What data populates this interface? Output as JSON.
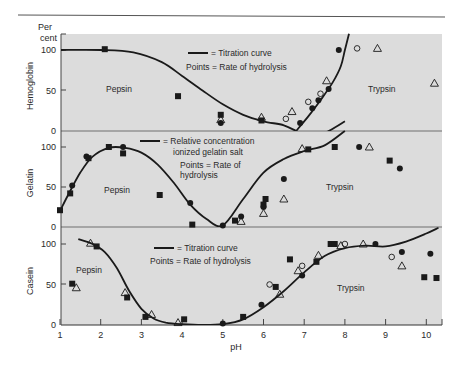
{
  "chart_data": {
    "type": "scatter",
    "title": "",
    "xlabel": "pH",
    "ylabel": "Per cent",
    "xlim": [
      1,
      10.3
    ],
    "x_ticks": [
      1,
      2,
      3,
      4,
      5,
      6,
      7,
      8,
      9,
      10
    ],
    "grid": false,
    "panels": [
      {
        "name": "Hemoglobin",
        "ylim": [
          0,
          100
        ],
        "y_ticks": [
          0,
          50,
          100
        ],
        "legend": [
          "= Titration curve",
          "Points = Rate of hydrolysis"
        ],
        "enzyme_labels": [
          {
            "text": "Pepsin",
            "x": 2.3,
            "y": 55
          },
          {
            "text": "Trypsin",
            "x": 8.5,
            "y": 48
          }
        ],
        "curves": [
          {
            "name": "Titration curve (acid)",
            "x": [
              1.0,
              2.0,
              2.8,
              3.5,
              4.0,
              4.5,
              5.0,
              5.5,
              6.0,
              6.5,
              6.8
            ],
            "y": [
              100,
              100,
              97,
              85,
              68,
              50,
              33,
              20,
              12,
              7,
              0
            ]
          },
          {
            "name": "Titration curve (alkaline)",
            "x": [
              6.8,
              7.1,
              7.4,
              7.7,
              7.9,
              8.0,
              8.1
            ],
            "y": [
              0,
              18,
              38,
              60,
              80,
              100,
              120
            ]
          },
          {
            "name": "Gelatin curve tail",
            "x": [
              6.1,
              6.6,
              7.1,
              7.6,
              8.0
            ],
            "y": [
              -30,
              -20,
              -10,
              0,
              12
            ]
          }
        ],
        "points": {
          "square": [
            [
              2.1,
              101
            ],
            [
              3.9,
              43
            ],
            [
              4.95,
              20
            ],
            [
              5.95,
              13
            ]
          ],
          "filled_circle": [
            [
              4.95,
              10
            ],
            [
              6.9,
              10
            ],
            [
              7.2,
              28
            ],
            [
              7.35,
              38
            ],
            [
              7.6,
              52
            ],
            [
              7.85,
              100
            ]
          ],
          "open_circle": [
            [
              6.55,
              15
            ],
            [
              7.1,
              36
            ],
            [
              7.4,
              46
            ],
            [
              8.3,
              102
            ]
          ],
          "triangle": [
            [
              4.95,
              14
            ],
            [
              5.95,
              17
            ],
            [
              6.7,
              24
            ],
            [
              7.55,
              62
            ],
            [
              8.8,
              102
            ],
            [
              10.2,
              59
            ]
          ]
        }
      },
      {
        "name": "Gelatin",
        "ylim": [
          0,
          100
        ],
        "y_ticks": [
          0,
          50,
          100
        ],
        "legend": [
          "= Relative concentration",
          "ionized gelatin salt",
          "Points = Rate of",
          "hydrolysis"
        ],
        "enzyme_labels": [
          {
            "text": "Pepsin",
            "x": 2.4,
            "y": 45
          },
          {
            "text": "Trypsin",
            "x": 7.7,
            "y": 47
          }
        ],
        "curves": [
          {
            "name": "Relative concentration ionized gelatin salt",
            "x": [
              1.0,
              1.2,
              1.5,
              1.8,
              2.2,
              2.6,
              3.0,
              3.4,
              3.8,
              4.2,
              4.6,
              5.0,
              5.5,
              6.0,
              6.5,
              7.0,
              7.5,
              8.0
            ],
            "y": [
              20,
              40,
              68,
              88,
              99,
              99,
              93,
              78,
              55,
              28,
              10,
              2,
              35,
              68,
              85,
              95,
              102,
              120
            ]
          }
        ],
        "points": {
          "square": [
            [
              1.0,
              21
            ],
            [
              1.25,
              42
            ],
            [
              1.7,
              86
            ],
            [
              2.2,
              100
            ],
            [
              2.55,
              92
            ],
            [
              3.45,
              40
            ],
            [
              4.25,
              3
            ],
            [
              5.3,
              8
            ],
            [
              6.0,
              28
            ],
            [
              6.05,
              35
            ],
            [
              7.1,
              97
            ],
            [
              7.75,
              100
            ],
            [
              9.1,
              83
            ]
          ],
          "filled_circle": [
            [
              1.3,
              52
            ],
            [
              1.65,
              88
            ],
            [
              2.55,
              100
            ],
            [
              4.2,
              30
            ],
            [
              5.0,
              2
            ],
            [
              5.45,
              13
            ],
            [
              6.0,
              25
            ],
            [
              6.5,
              60
            ],
            [
              8.35,
              100
            ],
            [
              9.35,
              73
            ]
          ],
          "open_circle": [],
          "triangle": [
            [
              5.45,
              7
            ],
            [
              6.0,
              17
            ],
            [
              6.5,
              35
            ],
            [
              6.95,
              98
            ],
            [
              8.6,
              100
            ]
          ]
        }
      },
      {
        "name": "Casein",
        "ylim": [
          0,
          100
        ],
        "y_ticks": [
          0,
          50,
          100
        ],
        "legend": [
          "= Titration curve",
          "Points = Rate of hydrolysis"
        ],
        "enzyme_labels": [
          {
            "text": "Pepsin",
            "x": 1.6,
            "y": 68
          },
          {
            "text": "Trypsin",
            "x": 7.7,
            "y": 31
          }
        ],
        "curves": [
          {
            "name": "Titration curve",
            "x": [
              1.45,
              1.8,
              2.1,
              2.4,
              2.7,
              3.0,
              3.3,
              3.6,
              4.0,
              4.5,
              5.0,
              5.5,
              6.0,
              6.5,
              7.0,
              7.5,
              8.0,
              8.5,
              9.0,
              9.5,
              10.0,
              10.3
            ],
            "y": [
              106,
              100,
              90,
              70,
              42,
              20,
              8,
              3,
              1,
              0,
              1,
              7,
              22,
              42,
              65,
              85,
              95,
              98,
              97,
              103,
              113,
              120
            ]
          }
        ],
        "points": {
          "square": [
            [
              1.3,
              51
            ],
            [
              1.9,
              97
            ],
            [
              2.65,
              34
            ],
            [
              3.1,
              10
            ],
            [
              4.05,
              7
            ],
            [
              5.5,
              10
            ],
            [
              6.3,
              47
            ],
            [
              6.65,
              81
            ],
            [
              7.3,
              78
            ],
            [
              7.65,
              100
            ],
            [
              7.75,
              100
            ],
            [
              9.95,
              59
            ],
            [
              10.25,
              58
            ]
          ],
          "filled_circle": [
            [
              5.0,
              2
            ],
            [
              5.95,
              25
            ],
            [
              6.95,
              61
            ],
            [
              8.75,
              100
            ],
            [
              9.4,
              90
            ],
            [
              10.1,
              88
            ]
          ],
          "open_circle": [
            [
              6.15,
              50
            ],
            [
              6.95,
              73
            ],
            [
              8.0,
              100
            ],
            [
              9.15,
              84
            ]
          ],
          "triangle": [
            [
              1.4,
              46
            ],
            [
              1.75,
              101
            ],
            [
              2.6,
              40
            ],
            [
              3.25,
              13
            ],
            [
              3.9,
              3
            ],
            [
              6.4,
              38
            ],
            [
              6.85,
              67
            ],
            [
              7.35,
              86
            ],
            [
              7.9,
              98
            ],
            [
              8.45,
              100
            ],
            [
              9.4,
              73
            ]
          ]
        }
      }
    ]
  },
  "labels": {
    "y_unit_line1": "Per",
    "y_unit_line2": "cent",
    "x_axis": "pH",
    "panel_names": [
      "Hemoglobin",
      "Gelatin",
      "Casein"
    ],
    "tick_0": "0",
    "tick_50": "50",
    "tick_100": "100",
    "x_ticks": [
      "1",
      "2",
      "3",
      "4",
      "5",
      "6",
      "7",
      "8",
      "9",
      "10"
    ],
    "hb_legend_line": "= Titration curve",
    "hb_legend_points": "Points = Rate of hydrolysis",
    "gel_legend_line1": "= Relative concentration",
    "gel_legend_line2": "ionized gelatin salt",
    "gel_legend_points1": "Points = Rate of",
    "gel_legend_points2": "hydrolysis",
    "cas_legend_line": "= Titration curve",
    "cas_legend_points": "Points = Rate of hydrolysis",
    "pepsin": "Pepsin",
    "trypsin": "Trypsin"
  },
  "colors": {
    "plot_bg": "#dcdcdc",
    "ink": "#1a1a1a",
    "divider": "#6e6e6e",
    "page_bg": "#ffffff"
  }
}
